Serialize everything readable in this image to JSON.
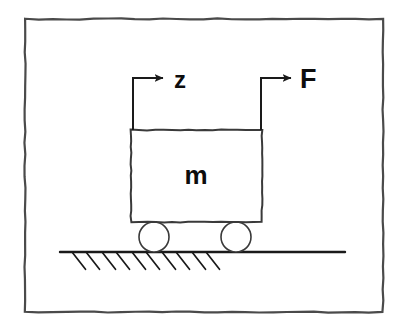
{
  "figure": {
    "kind": "free-body-diagram",
    "background_color": "#ffffff",
    "ink_color": "#1a1a1a",
    "frame": {
      "name": "figure-border",
      "x": 25,
      "y": 19,
      "width": 358,
      "height": 293,
      "stroke_width": 2.2,
      "style": "hand-drawn-rough-rectangle"
    },
    "body": {
      "label": "m",
      "description": "rectangular mass block",
      "x": 131,
      "y": 130,
      "width": 131,
      "height": 92,
      "stroke_width": 2.0,
      "label_x": 196,
      "label_y": 184,
      "label_font_size": 26
    },
    "wheels": [
      {
        "name": "wheel-left",
        "cx": 154,
        "cy": 237,
        "r": 15,
        "stroke_width": 1.6
      },
      {
        "name": "wheel-right",
        "cx": 236,
        "cy": 237,
        "r": 15,
        "stroke_width": 1.6
      }
    ],
    "ground": {
      "name": "ground-line",
      "x1": 60,
      "y1": 252,
      "x2": 345,
      "y2": 252,
      "stroke_width": 2.4,
      "hatch_count": 10,
      "hatch_length": 22,
      "hatch_angle_deg": 52,
      "hatch_stroke_width": 1.7,
      "hatch_start_x": 72,
      "hatch_spacing": 30,
      "hatch_pair_offset": 14
    },
    "arrows": [
      {
        "name": "displacement-arrow",
        "label": "z",
        "label_case": "lowercase",
        "stem_x": 133,
        "stem_top_y": 78,
        "stem_bottom_y": 130,
        "head_x": 163,
        "head_y": 78,
        "label_x": 174,
        "label_y": 88,
        "label_font_size": 24,
        "stroke_width": 2.0,
        "direction": "right"
      },
      {
        "name": "force-arrow",
        "label": "F",
        "label_case": "uppercase",
        "stem_x": 261,
        "stem_top_y": 78,
        "stem_bottom_y": 130,
        "head_x": 291,
        "head_y": 78,
        "label_x": 300,
        "label_y": 88,
        "label_font_size": 27,
        "stroke_width": 2.0,
        "direction": "right"
      }
    ]
  }
}
